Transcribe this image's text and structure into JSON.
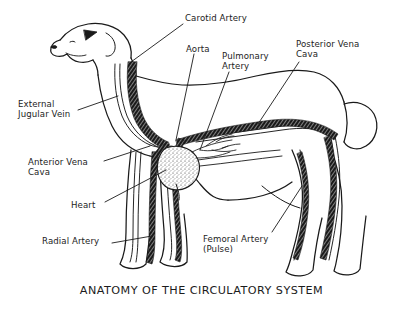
{
  "figure": {
    "title": "ANATOMY OF THE CIRCULATORY SYSTEM",
    "background_color": "#ffffff",
    "ink_color": "#1a1a1a"
  },
  "labels": {
    "carotid_artery": "Carotid Artery",
    "aorta": "Aorta",
    "pulmonary_artery": "Pulmonary\nArtery",
    "posterior_vena_cava": "Posterior Vena\nCava",
    "external_jugular_vein": "External\nJugular Vein",
    "anterior_vena_cava": "Anterior Vena\nCava",
    "heart": "Heart",
    "radial_artery": "Radial Artery",
    "femoral_artery": "Femoral Artery\n(Pulse)"
  }
}
